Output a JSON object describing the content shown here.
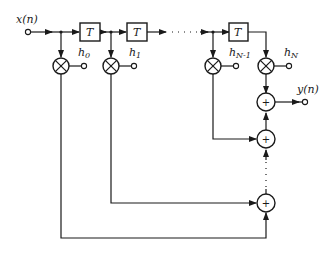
{
  "diagram": {
    "type": "FIR filter transversal (direct form) structure",
    "input": {
      "label": "x(n)"
    },
    "output": {
      "label": "y(n)"
    },
    "delays": [
      {
        "label": "T"
      },
      {
        "label": "T"
      },
      {
        "label": "T"
      }
    ],
    "coefficients": [
      {
        "base": "h",
        "sub": "0"
      },
      {
        "base": "h",
        "sub": "1"
      },
      {
        "base": "h",
        "sub": "N-1"
      },
      {
        "base": "h",
        "sub": "N"
      }
    ],
    "multiplier_symbol": "⊗",
    "adder_symbol": "+",
    "colors": {
      "ink": "#1a1a1a",
      "background": "#ffffff"
    }
  }
}
